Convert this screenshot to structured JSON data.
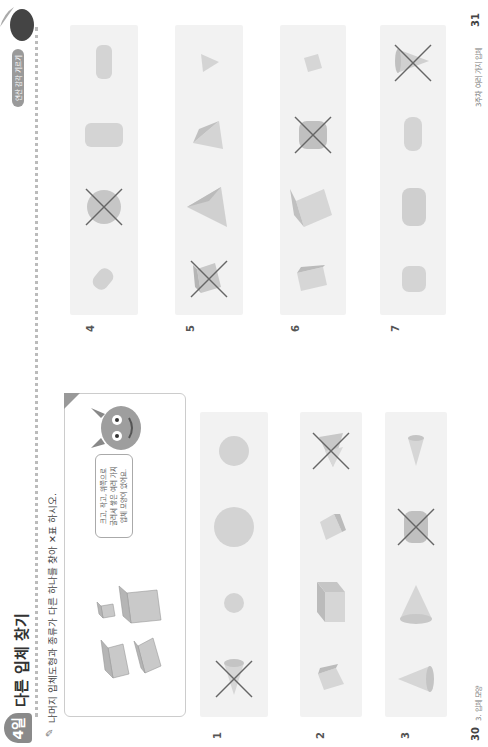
{
  "header": {
    "day_badge": "4일",
    "title": "다른 입체 찾기",
    "chip": "연산 감각 기르기",
    "instruction": "나머지 입체도형과 종류가 다른 하나를 찾아 ✕표 하시오."
  },
  "example": {
    "bubble_text": [
      "크고, 작고, 위쪽으로",
      "굴러서 쌓은 여러 가지",
      "입체 모양이 있어요."
    ],
    "shapes": [
      "cuboid",
      "cuboid",
      "cube-small",
      "cube-large"
    ]
  },
  "problems": [
    {
      "number": "1",
      "shapes": [
        "cone",
        "sphere-small",
        "sphere-large",
        "sphere"
      ],
      "crossed_index": 0
    },
    {
      "number": "2",
      "shapes": [
        "cube",
        "cuboid-large",
        "cuboid",
        "triangular-prism"
      ],
      "crossed_index": 3
    },
    {
      "number": "3",
      "shapes": [
        "cone",
        "cone-large",
        "cylinder",
        "cone-small"
      ],
      "crossed_index": 2
    },
    {
      "number": "4",
      "shapes": [
        "cylinder-small",
        "sphere",
        "cylinder-lying",
        "cylinder-tall"
      ],
      "crossed_index": 1
    },
    {
      "number": "5",
      "shapes": [
        "prism",
        "pyramid-large",
        "pyramid",
        "pyramid-small"
      ],
      "crossed_index": 0
    },
    {
      "number": "6",
      "shapes": [
        "cuboid",
        "cube-large",
        "cylinder",
        "cube-small"
      ],
      "crossed_index": 2
    },
    {
      "number": "7",
      "shapes": [
        "cylinder-short",
        "cylinder-tall",
        "cylinder-flat",
        "cone"
      ],
      "crossed_index": 3
    }
  ],
  "footer": {
    "left_page": "30",
    "left_label": "3. 입체 모양",
    "right_page": "31",
    "right_label": "3주차 여러 가지 입체"
  },
  "colors": {
    "row_bg": "#f2f2f2",
    "shape_fill": "#d6d6d6",
    "shape_dark": "#b8b8b8",
    "cross": "#666666"
  }
}
